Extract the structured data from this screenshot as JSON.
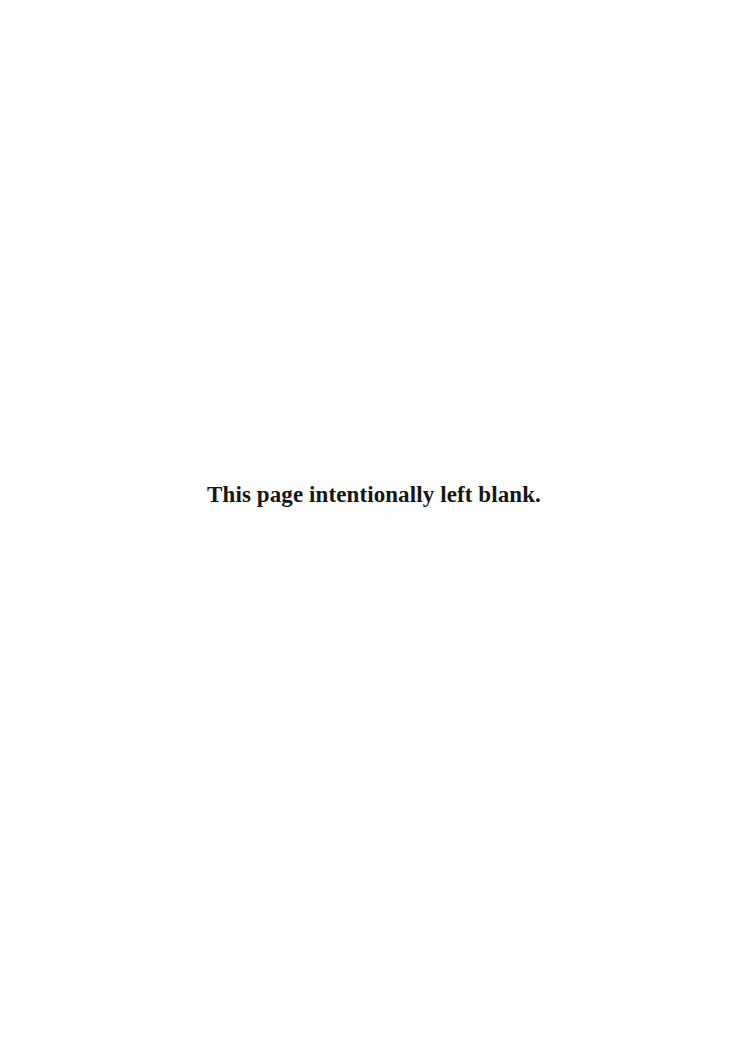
{
  "page": {
    "notice": "This page intentionally left blank."
  }
}
